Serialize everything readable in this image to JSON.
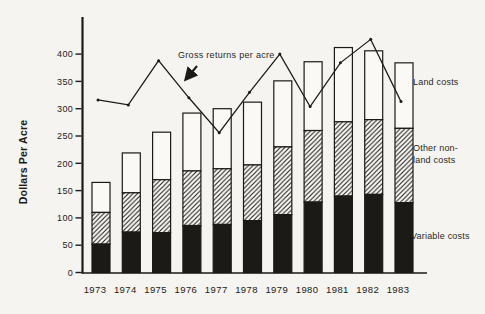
{
  "figure": {
    "background": "#f5f4f0",
    "ink": "#1c1a16",
    "bar_fill_white": "#faf9f6"
  },
  "chart_data": {
    "type": "bar",
    "subtype": "stacked-bars-with-line-overlay",
    "title": "",
    "xlabel": "",
    "ylabel": "Dollars Per Acre",
    "ylim": [
      0,
      450
    ],
    "yticks": [
      0,
      50,
      100,
      150,
      200,
      250,
      300,
      350,
      400
    ],
    "grid": false,
    "categories": [
      "1973",
      "1974",
      "1975",
      "1976",
      "1977",
      "1978",
      "1979",
      "1980",
      "1981",
      "1982",
      "1983"
    ],
    "stacked_series": [
      {
        "name": "Variable costs",
        "style": "solid-black",
        "values": [
          52,
          74,
          73,
          86,
          88,
          95,
          106,
          129,
          140,
          143,
          128
        ]
      },
      {
        "name": "Other non-land costs",
        "style": "diagonal-hatch",
        "values": [
          58,
          72,
          97,
          100,
          102,
          102,
          124,
          131,
          136,
          137,
          136
        ]
      },
      {
        "name": "Land costs",
        "style": "white-outline",
        "values": [
          55,
          73,
          87,
          106,
          110,
          115,
          121,
          126,
          136,
          126,
          120
        ]
      }
    ],
    "stacked_totals": [
      165,
      219,
      257,
      292,
      300,
      312,
      351,
      386,
      412,
      406,
      384
    ],
    "line_series": {
      "name": "Gross returns per acre",
      "marker": "dot",
      "values": [
        316,
        307,
        388,
        320,
        256,
        330,
        400,
        304,
        384,
        427,
        313
      ]
    },
    "annotation": {
      "text": "Gross returns per acre",
      "arrow_points_to": "line segment between 1975 and 1977"
    },
    "side_labels": [
      {
        "id": "land-costs-label",
        "text": "Land costs"
      },
      {
        "id": "other-nonland-label",
        "text": "Other non-\nland costs"
      },
      {
        "id": "variable-costs-label",
        "text": "Variable costs"
      }
    ],
    "legend_position": "right-side-labels"
  }
}
